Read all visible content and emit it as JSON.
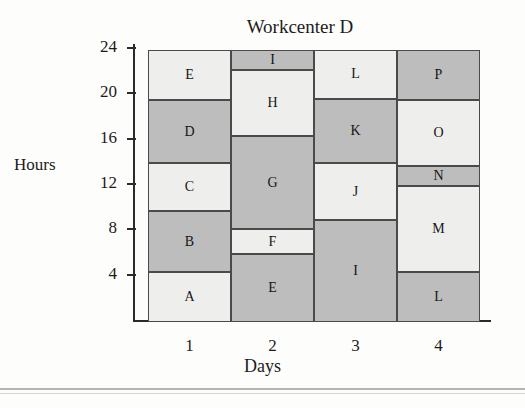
{
  "page": {
    "scan_top_text_fragment": "",
    "background_color": "#fdfdfb"
  },
  "chart_data": {
    "type": "bar",
    "subtype": "stacked-bar",
    "title": "Workcenter D",
    "xlabel": "Days",
    "ylabel": "Hours",
    "categories": [
      "1",
      "2",
      "3",
      "4"
    ],
    "ylim": [
      0,
      24
    ],
    "yticks": [
      4,
      8,
      12,
      16,
      20,
      24
    ],
    "ytick_labels": [
      "4",
      "8",
      "12",
      "16",
      "20",
      "24"
    ],
    "grid": false,
    "legend": "none",
    "colors": {
      "light_segment": "#eeeeec",
      "dark_segment": "#bdbdbd",
      "segment_border": "#4a4a4a",
      "axis": "#2b2b2b",
      "text": "#1c1c1c"
    },
    "columns": [
      {
        "day": "1",
        "segments": [
          {
            "label": "A",
            "start": 0.0,
            "end": 4.4,
            "value": 4.4,
            "shade": "light"
          },
          {
            "label": "B",
            "start": 4.4,
            "end": 9.8,
            "value": 5.4,
            "shade": "dark"
          },
          {
            "label": "C",
            "start": 9.8,
            "end": 14.0,
            "value": 4.2,
            "shade": "light"
          },
          {
            "label": "D",
            "start": 14.0,
            "end": 19.6,
            "value": 5.6,
            "shade": "dark"
          },
          {
            "label": "E",
            "start": 19.6,
            "end": 24.0,
            "value": 4.4,
            "shade": "light"
          }
        ]
      },
      {
        "day": "2",
        "segments": [
          {
            "label": "E",
            "start": 0.0,
            "end": 6.0,
            "value": 6.0,
            "shade": "dark"
          },
          {
            "label": "F",
            "start": 6.0,
            "end": 8.2,
            "value": 2.2,
            "shade": "light"
          },
          {
            "label": "G",
            "start": 8.2,
            "end": 16.4,
            "value": 8.2,
            "shade": "dark"
          },
          {
            "label": "H",
            "start": 16.4,
            "end": 22.2,
            "value": 5.8,
            "shade": "light"
          },
          {
            "label": "I",
            "start": 22.2,
            "end": 24.0,
            "value": 1.8,
            "shade": "dark"
          }
        ]
      },
      {
        "day": "3",
        "segments": [
          {
            "label": "I",
            "start": 0.0,
            "end": 9.0,
            "value": 9.0,
            "shade": "dark"
          },
          {
            "label": "J",
            "start": 9.0,
            "end": 14.0,
            "value": 5.0,
            "shade": "light"
          },
          {
            "label": "K",
            "start": 14.0,
            "end": 19.7,
            "value": 5.7,
            "shade": "dark"
          },
          {
            "label": "L",
            "start": 19.7,
            "end": 24.0,
            "value": 4.3,
            "shade": "light"
          }
        ]
      },
      {
        "day": "4",
        "segments": [
          {
            "label": "L",
            "start": 0.0,
            "end": 4.4,
            "value": 4.4,
            "shade": "dark"
          },
          {
            "label": "M",
            "start": 4.4,
            "end": 12.0,
            "value": 7.6,
            "shade": "light"
          },
          {
            "label": "N",
            "start": 12.0,
            "end": 13.8,
            "value": 1.8,
            "shade": "dark"
          },
          {
            "label": "O",
            "start": 13.8,
            "end": 19.6,
            "value": 5.8,
            "shade": "light"
          },
          {
            "label": "P",
            "start": 19.6,
            "end": 24.0,
            "value": 4.4,
            "shade": "dark"
          }
        ]
      }
    ]
  }
}
